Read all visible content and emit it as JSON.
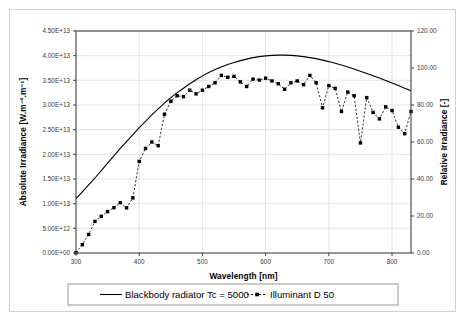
{
  "figure": {
    "background": "#ffffff",
    "border_color": "#d0d0d0",
    "series_color": "#000000",
    "grid_color": "#d9d9d9"
  },
  "chart_data": {
    "type": "line",
    "title": "",
    "xlabel": "Wavelength [nm]",
    "ylabel": "Absolute Irradiance [W.m⁻².m⁻¹]",
    "y2label": "Relative Irradiance [-]",
    "xlim": [
      300,
      830
    ],
    "ylim": [
      0,
      45000000000000
    ],
    "y2lim": [
      0,
      120
    ],
    "grid": true,
    "legend_position": "below",
    "xticks": [
      300,
      400,
      500,
      600,
      700,
      800
    ],
    "xticklabels": [
      "300",
      "400",
      "500",
      "600",
      "700",
      "800"
    ],
    "yticks": [
      0,
      5000000000000,
      10000000000000,
      15000000000000,
      20000000000000,
      25000000000000,
      30000000000000,
      35000000000000,
      40000000000000,
      45000000000000
    ],
    "yticklabels": [
      "0.00E+00",
      "5.00E+12",
      "1.00E+13",
      "1.50E+13",
      "2.00E+13",
      "2.50E+13",
      "3.00E+13",
      "3.50E+13",
      "4.00E+13",
      "4.50E+13"
    ],
    "y2ticks": [
      0,
      20,
      40,
      60,
      80,
      100,
      120
    ],
    "y2ticklabels": [
      "0.00",
      "20.00",
      "40.00",
      "60.00",
      "80.00",
      "100.00",
      "120.00"
    ],
    "series": [
      {
        "name": "Blackbody radiator Tc = 5000",
        "axis": "left",
        "style": "solid",
        "marker": "none",
        "x": [
          300,
          310,
          320,
          330,
          340,
          350,
          360,
          370,
          380,
          390,
          400,
          410,
          420,
          430,
          440,
          450,
          460,
          470,
          480,
          490,
          500,
          510,
          520,
          530,
          540,
          550,
          560,
          570,
          580,
          590,
          600,
          610,
          620,
          630,
          640,
          650,
          660,
          670,
          680,
          690,
          700,
          710,
          720,
          730,
          740,
          750,
          760,
          770,
          780,
          790,
          800,
          810,
          820,
          830
        ],
        "values": [
          11000000000000,
          12400000000000,
          13800000000000,
          15200000000000,
          16700000000000,
          18200000000000,
          19700000000000,
          21200000000000,
          22600000000000,
          24000000000000,
          25400000000000,
          26700000000000,
          28000000000000,
          29200000000000,
          30400000000000,
          31500000000000,
          32500000000000,
          33400000000000,
          34300000000000,
          35100000000000,
          35900000000000,
          36600000000000,
          37200000000000,
          37700000000000,
          38200000000000,
          38600000000000,
          39000000000000,
          39300000000000,
          39600000000000,
          39800000000000,
          39950000000000,
          40050000000000,
          40100000000000,
          40100000000000,
          40050000000000,
          39950000000000,
          39800000000000,
          39600000000000,
          39400000000000,
          39100000000000,
          38800000000000,
          38450000000000,
          38100000000000,
          37700000000000,
          37300000000000,
          36850000000000,
          36400000000000,
          35950000000000,
          35450000000000,
          34950000000000,
          34450000000000,
          33950000000000,
          33400000000000,
          32900000000000
        ]
      },
      {
        "name": "Illuminant D 50",
        "axis": "right",
        "style": "dashed",
        "marker": "square",
        "x": [
          300,
          310,
          320,
          330,
          340,
          350,
          360,
          370,
          380,
          390,
          400,
          410,
          420,
          430,
          440,
          450,
          460,
          470,
          480,
          490,
          500,
          510,
          520,
          530,
          540,
          550,
          560,
          570,
          580,
          590,
          600,
          610,
          620,
          630,
          640,
          650,
          660,
          670,
          680,
          690,
          700,
          710,
          720,
          730,
          740,
          750,
          760,
          770,
          780,
          790,
          800,
          810,
          820,
          830
        ],
        "values": [
          0.2,
          4.5,
          10.0,
          17.1,
          19.8,
          22.4,
          24.5,
          27.2,
          24.4,
          29.8,
          49.5,
          56.5,
          60.0,
          58.0,
          75.0,
          82.0,
          85.0,
          84.5,
          88.0,
          86.0,
          88.0,
          90.0,
          92.0,
          96.0,
          95.0,
          95.5,
          92.5,
          90.0,
          94.0,
          93.5,
          94.5,
          93.0,
          91.5,
          88.5,
          92.0,
          93.0,
          91.0,
          96.0,
          92.0,
          78.5,
          90.5,
          89.0,
          76.5,
          87.0,
          85.0,
          59.5,
          84.0,
          76.0,
          72.5,
          79.0,
          77.0,
          68.0,
          64.5,
          76.5
        ]
      }
    ]
  },
  "legend": {
    "items": [
      {
        "label": "Blackbody radiator Tc = 5000",
        "style": "solid"
      },
      {
        "label": "Illuminant D 50",
        "style": "dashed-marker"
      }
    ]
  }
}
